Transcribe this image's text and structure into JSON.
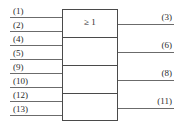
{
  "diagram": {
    "kind": "iec-logic-symbol",
    "device": "quad 2-input OR gate",
    "symbol": {
      "text": "≥ 1",
      "name": "or-gate-iec-qualifier"
    },
    "colors": {
      "outline": "#4a4a4a",
      "lead": "#6b6b6b",
      "text": "#2b2b2b",
      "background": "#ffffff"
    },
    "sections": [
      {
        "id": "section-1",
        "inputs": [
          "(1)",
          "(2)"
        ],
        "output": "(3)"
      },
      {
        "id": "section-2",
        "inputs": [
          "(4)",
          "(5)"
        ],
        "output": "(6)"
      },
      {
        "id": "section-3",
        "inputs": [
          "(9)",
          "(10)"
        ],
        "output": "(8)"
      },
      {
        "id": "section-4",
        "inputs": [
          "(12)",
          "(13)"
        ],
        "output": "(11)"
      }
    ],
    "input_pins": [
      {
        "label": "(1)",
        "y": 17
      },
      {
        "label": "(2)",
        "y": 31
      },
      {
        "label": "(4)",
        "y": 45
      },
      {
        "label": "(5)",
        "y": 59
      },
      {
        "label": "(9)",
        "y": 73
      },
      {
        "label": "(10)",
        "y": 87
      },
      {
        "label": "(12)",
        "y": 101
      },
      {
        "label": "(13)",
        "y": 115
      }
    ],
    "output_pins": [
      {
        "label": "(3)",
        "y": 24
      },
      {
        "label": "(6)",
        "y": 52
      },
      {
        "label": "(8)",
        "y": 80
      },
      {
        "label": "(11)",
        "y": 108
      }
    ]
  }
}
